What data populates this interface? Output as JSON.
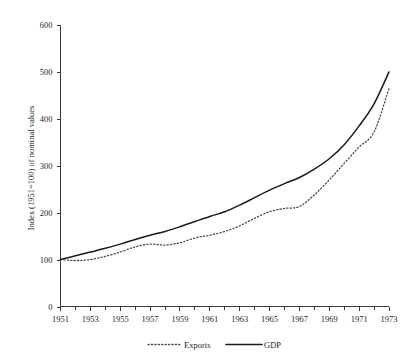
{
  "chart_data": {
    "type": "line",
    "title": "",
    "subtitle": "",
    "xlabel": "",
    "ylabel": "Index (1951=100) of nominal values",
    "xlim": [
      1951,
      1973
    ],
    "ylim": [
      0,
      600
    ],
    "grid": false,
    "legend_position": "bottom",
    "y_ticks": [
      0,
      100,
      200,
      300,
      400,
      500,
      600
    ],
    "y_tick_labels": [
      "0",
      "100",
      "200",
      "300",
      "400",
      "500",
      "600"
    ],
    "x_ticks": [
      1951,
      1953,
      1955,
      1957,
      1959,
      1961,
      1963,
      1965,
      1967,
      1969,
      1971,
      1973
    ],
    "x_tick_labels": [
      "1951",
      "1953",
      "1955",
      "1957",
      "1959",
      "1961",
      "1963",
      "1965",
      "1967",
      "1969",
      "1971",
      "1973"
    ],
    "x_minor_ticks": [
      1952,
      1954,
      1956,
      1958,
      1960,
      1962,
      1964,
      1966,
      1968,
      1970,
      1972
    ],
    "x": [
      1951,
      1952,
      1953,
      1954,
      1955,
      1956,
      1957,
      1958,
      1959,
      1960,
      1961,
      1962,
      1963,
      1964,
      1965,
      1966,
      1967,
      1968,
      1969,
      1970,
      1971,
      1972,
      1973
    ],
    "series": [
      {
        "name": "Exports",
        "style": "dotted",
        "color": "#4a4a4a",
        "values": [
          100,
          98,
          100,
          107,
          116,
          127,
          133,
          131,
          136,
          146,
          152,
          160,
          172,
          188,
          202,
          209,
          213,
          238,
          270,
          305,
          340,
          372,
          465
        ]
      },
      {
        "name": "GDP",
        "style": "solid",
        "color": "#1a1a1a",
        "values": [
          100,
          108,
          116,
          124,
          133,
          143,
          152,
          160,
          170,
          181,
          192,
          202,
          216,
          232,
          248,
          262,
          275,
          293,
          315,
          345,
          385,
          432,
          500
        ]
      }
    ],
    "legend": [
      {
        "label": "Exports",
        "style": "dotted"
      },
      {
        "label": "GDP",
        "style": "solid"
      }
    ]
  },
  "colors": {
    "background": "#ffffff",
    "axis": "#3a3a3a",
    "text": "#1f1f1f",
    "gdp_line": "#1a1a1a",
    "exports_line": "#4a4a4a"
  }
}
